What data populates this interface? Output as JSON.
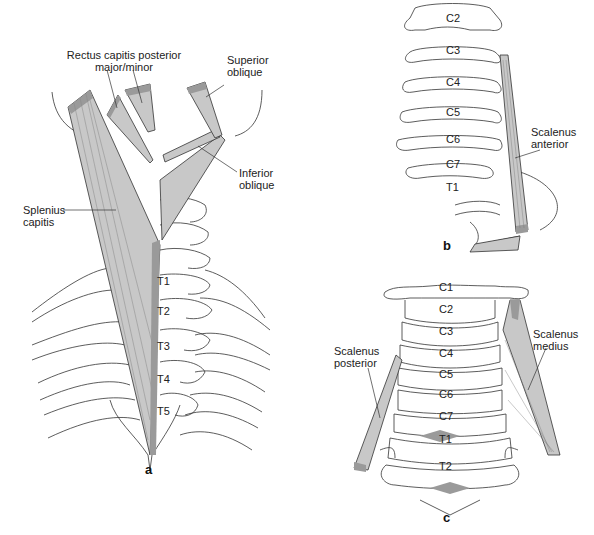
{
  "figure": {
    "panels": [
      {
        "id": "a",
        "label": "a",
        "muscles": [
          {
            "name": "Rectus capitis posterior major/minor",
            "line1": "Rectus capitis posterior",
            "line2": "major/minor"
          },
          {
            "name": "Superior oblique",
            "line1": "Superior",
            "line2": "oblique"
          },
          {
            "name": "Inferior oblique",
            "line1": "Inferior",
            "line2": "oblique"
          },
          {
            "name": "Splenius capitis",
            "line1": "Splenius",
            "line2": "capitis"
          }
        ],
        "vertebrae": [
          "T1",
          "T2",
          "T3",
          "T4",
          "T5"
        ]
      },
      {
        "id": "b",
        "label": "b",
        "muscles": [
          {
            "name": "Scalenus anterior",
            "line1": "Scalenus",
            "line2": "anterior"
          }
        ],
        "vertebrae": [
          "C2",
          "C3",
          "C4",
          "C5",
          "C6",
          "C7",
          "T1"
        ]
      },
      {
        "id": "c",
        "label": "c",
        "muscles": [
          {
            "name": "Scalenus medius",
            "line1": "Scalenus",
            "line2": "medius"
          },
          {
            "name": "Scalenus posterior",
            "line1": "Scalenus",
            "line2": "posterior"
          }
        ],
        "vertebrae": [
          "C1",
          "C2",
          "C3",
          "C4",
          "C5",
          "C6",
          "C7",
          "T1",
          "T2"
        ]
      }
    ],
    "colors": {
      "muscle_fill": "#c8c8c8",
      "muscle_tendon": "#9a9a9a",
      "outline": "#333333",
      "background": "#ffffff"
    }
  }
}
